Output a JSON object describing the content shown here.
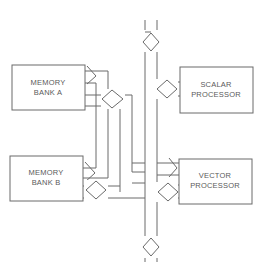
{
  "diagram": {
    "type": "bus-architecture",
    "blocks": {
      "memory_bank_a": {
        "line1": "MEMORY",
        "line2": "BANK A"
      },
      "memory_bank_b": {
        "line1": "MEMORY",
        "line2": "BANK B"
      },
      "scalar_processor": {
        "line1": "SCALAR",
        "line2": "PROCESSOR"
      },
      "vector_processor": {
        "line1": "VECTOR",
        "line2": "PROCESSOR"
      }
    },
    "connectors": [
      {
        "from": "memory_bank_a",
        "type": "unidirectional"
      },
      {
        "from": "memory_bank_a",
        "type": "bidirectional"
      },
      {
        "from": "memory_bank_b",
        "type": "unidirectional"
      },
      {
        "from": "memory_bank_b",
        "type": "bidirectional"
      },
      {
        "to": "scalar_processor",
        "type": "bidirectional"
      },
      {
        "to": "vector_processor",
        "type": "unidirectional"
      },
      {
        "to": "vector_processor",
        "type": "bidirectional"
      },
      {
        "on": "system_bus_top",
        "type": "bidirectional"
      },
      {
        "on": "system_bus_bottom",
        "type": "bidirectional"
      }
    ],
    "colors": {
      "line": "#6a6a6a",
      "text": "#5a5a5a",
      "background": "#ffffff"
    }
  }
}
